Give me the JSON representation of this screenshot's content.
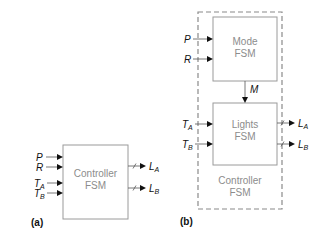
{
  "panels": {
    "a": {
      "label": "(a)",
      "controller": {
        "line1": "Controller",
        "line2": "FSM"
      },
      "inputs": [
        {
          "name": "P",
          "sub": ""
        },
        {
          "name": "R",
          "sub": ""
        },
        {
          "name": "T",
          "sub": "A"
        },
        {
          "name": "T",
          "sub": "B"
        }
      ],
      "outputs": [
        {
          "name": "L",
          "sub": "A"
        },
        {
          "name": "L",
          "sub": "B"
        }
      ]
    },
    "b": {
      "label": "(b)",
      "mode_fsm": {
        "line1": "Mode",
        "line2": "FSM"
      },
      "lights_fsm": {
        "line1": "Lights",
        "line2": "FSM"
      },
      "controller": {
        "line1": "Controller",
        "line2": "FSM"
      },
      "internal_signal": "M",
      "mode_inputs": [
        {
          "name": "P",
          "sub": ""
        },
        {
          "name": "R",
          "sub": ""
        }
      ],
      "lights_inputs": [
        {
          "name": "T",
          "sub": "A"
        },
        {
          "name": "T",
          "sub": "B"
        }
      ],
      "outputs": [
        {
          "name": "L",
          "sub": "A"
        },
        {
          "name": "L",
          "sub": "B"
        }
      ]
    }
  }
}
